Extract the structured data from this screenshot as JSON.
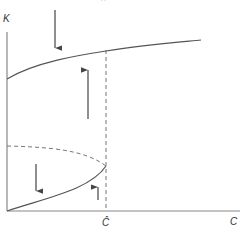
{
  "diagram": {
    "axes": {
      "y_label": "K",
      "x_label": "C",
      "x_marker_label": "Ĉ"
    },
    "top_cropped_glyph": "··",
    "curves": [
      {
        "name": "upper-stable-branch",
        "style": "solid"
      },
      {
        "name": "unstable-branch",
        "style": "dashed"
      },
      {
        "name": "lower-stable-branch",
        "style": "solid"
      },
      {
        "name": "critical-c-line",
        "style": "dashed"
      }
    ],
    "arrows": [
      {
        "name": "arrow-down-top",
        "direction": "down"
      },
      {
        "name": "arrow-up-middle",
        "direction": "up"
      },
      {
        "name": "arrow-down-bottom-left",
        "direction": "down"
      },
      {
        "name": "arrow-up-bottom-right",
        "direction": "up"
      }
    ],
    "colors": {
      "axis": "#888888",
      "curve": "#555555",
      "arrow": "#444444",
      "dashed": "#777777"
    }
  }
}
